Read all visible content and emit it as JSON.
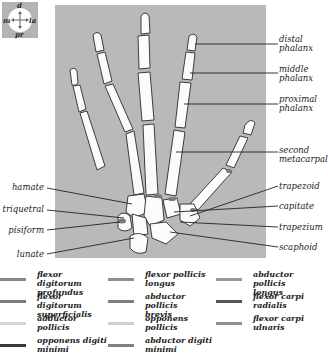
{
  "orientation_compass": {
    "top": "d",
    "left": "m",
    "right": "la",
    "bottom": "pr"
  },
  "bone_labels_right": [
    {
      "text": "distal phalanx",
      "line1": "distal",
      "line2": "phalanx"
    },
    {
      "text": "middle phalanx",
      "line1": "middle",
      "line2": "phalanx"
    },
    {
      "text": "proximal phalanx",
      "line1": "proximal",
      "line2": "phalanx"
    },
    {
      "text": "second metacarpal",
      "line1": "second",
      "line2": "metacarpal"
    },
    {
      "text": "trapezoid",
      "line1": "trapezoid"
    },
    {
      "text": "capitate",
      "line1": "capitate"
    },
    {
      "text": "trapezium",
      "line1": "trapezium"
    },
    {
      "text": "scaphoid",
      "line1": "scaphoid"
    }
  ],
  "bone_labels_left": [
    {
      "text": "hamate"
    },
    {
      "text": "triquetral"
    },
    {
      "text": "pisiform"
    },
    {
      "text": "lunate"
    }
  ],
  "legend": [
    {
      "line1": "flexor digitorum",
      "line2": "profundus",
      "color": "#8a8a8a"
    },
    {
      "line1": "flexor digitorum",
      "line2": "superficialis",
      "color": "#7c7c7c"
    },
    {
      "line1": "adductor",
      "line2": "pollicis",
      "color": "#d4d4d4"
    },
    {
      "line1": "opponens digiti",
      "line2": "minimi",
      "color": "#3a3a3a"
    },
    {
      "line1": "flexor pollicis",
      "line2": "longus",
      "color": "#8d8d8d"
    },
    {
      "line1": "abductor pollicis",
      "line2": "brevis",
      "color": "#7f7f7f"
    },
    {
      "line1": "opponens",
      "line2": "pollicis",
      "color": "#cfcfcf"
    },
    {
      "line1": "abductor digiti",
      "line2": "minimi",
      "color": "#808080"
    },
    {
      "line1": "abductor pollicis",
      "line2": "longus",
      "color": "#999999"
    },
    {
      "line1": "flexor carpi",
      "line2": "radialis",
      "color": "#555555"
    },
    {
      "line1": "flexor carpi",
      "line2": "ulnaris",
      "color": "#8f8f8f"
    }
  ]
}
